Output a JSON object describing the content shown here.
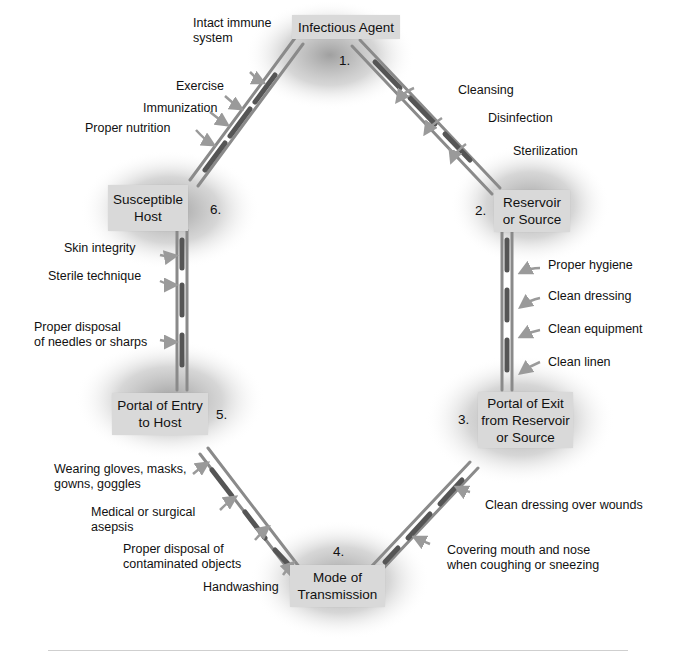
{
  "diagram": {
    "type": "cycle",
    "nodes": [
      {
        "id": "n1",
        "number": "1.",
        "label": "Infectious Agent"
      },
      {
        "id": "n2",
        "number": "2.",
        "label_line1": "Reservoir",
        "label_line2": "or Source"
      },
      {
        "id": "n3",
        "number": "3.",
        "label_line1": "Portal of Exit",
        "label_line2": "from Reservoir",
        "label_line3": "or Source"
      },
      {
        "id": "n4",
        "number": "4.",
        "label_line1": "Mode of",
        "label_line2": "Transmission"
      },
      {
        "id": "n5",
        "number": "5.",
        "label_line1": "Portal of Entry",
        "label_line2": "to Host"
      },
      {
        "id": "n6",
        "number": "6.",
        "label_line1": "Susceptible",
        "label_line2": "Host"
      }
    ],
    "links": [
      {
        "from": "1",
        "to": "2",
        "interventions": [
          "Cleansing",
          "Disinfection",
          "Sterilization"
        ]
      },
      {
        "from": "2",
        "to": "3",
        "interventions": [
          "Proper hygiene",
          "Clean dressing",
          "Clean equipment",
          "Clean linen"
        ]
      },
      {
        "from": "3",
        "to": "4",
        "interventions": [
          "Clean dressing over wounds",
          "Covering mouth and nose when coughing or sneezing"
        ]
      },
      {
        "from": "4",
        "to": "5",
        "interventions": [
          "Wearing gloves, masks, gowns, goggles",
          "Medical or surgical asepsis",
          "Proper disposal of contaminated objects",
          "Handwashing"
        ]
      },
      {
        "from": "5",
        "to": "6",
        "interventions": [
          "Skin integrity",
          "Sterile technique",
          "Proper disposal of needles or sharps"
        ]
      },
      {
        "from": "6",
        "to": "1",
        "interventions": [
          "Intact immune system",
          "Exercise",
          "Immunization",
          "Proper nutrition"
        ]
      }
    ]
  },
  "labels": {
    "l61_a1": "Intact immune",
    "l61_a2": "system",
    "l61_b": "Exercise",
    "l61_c": "Immunization",
    "l61_d": "Proper nutrition",
    "l12_a": "Cleansing",
    "l12_b": "Disinfection",
    "l12_c": "Sterilization",
    "l23_a": "Proper hygiene",
    "l23_b": "Clean dressing",
    "l23_c": "Clean equipment",
    "l23_d": "Clean linen",
    "l34_a": "Clean dressing over wounds",
    "l34_b1": "Covering mouth and nose",
    "l34_b2": "when coughing or sneezing",
    "l45_a1": "Wearing gloves, masks,",
    "l45_a2": "gowns, goggles",
    "l45_b1": "Medical or surgical",
    "l45_b2": "asepsis",
    "l45_c1": "Proper disposal of",
    "l45_c2": "contaminated objects",
    "l45_d": "Handwashing",
    "l56_a": "Skin integrity",
    "l56_b": "Sterile technique",
    "l56_c1": "Proper disposal",
    "l56_c2": "of needles or sharps"
  },
  "colors": {
    "box_fill": "#d9d9d9",
    "chain_rail": "#8a8a8a",
    "chain_link": "#555555",
    "arrow": "#9a9a9a",
    "halo": "#9e9e9e"
  }
}
